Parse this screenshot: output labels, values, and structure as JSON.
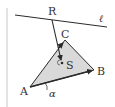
{
  "diagram": {
    "type": "geometry",
    "colors": {
      "stroke": "#2a2a2a",
      "fill": "#d9d9d9",
      "frame": "#bfbfbf",
      "text": "#333333"
    },
    "points": {
      "A": {
        "label": "A",
        "x": 30,
        "y": 87
      },
      "B": {
        "label": "B",
        "x": 94,
        "y": 70
      },
      "C": {
        "label": "C",
        "x": 65,
        "y": 40
      },
      "R": {
        "label": "R",
        "x": 52,
        "y": 20
      },
      "S": {
        "label": "S",
        "x": 62,
        "y": 63
      }
    },
    "line": {
      "label": "ℓ",
      "x1": 15,
      "y1": 15,
      "x2": 107,
      "y2": 27
    },
    "angle": {
      "label": "α",
      "vertex": "A"
    }
  }
}
